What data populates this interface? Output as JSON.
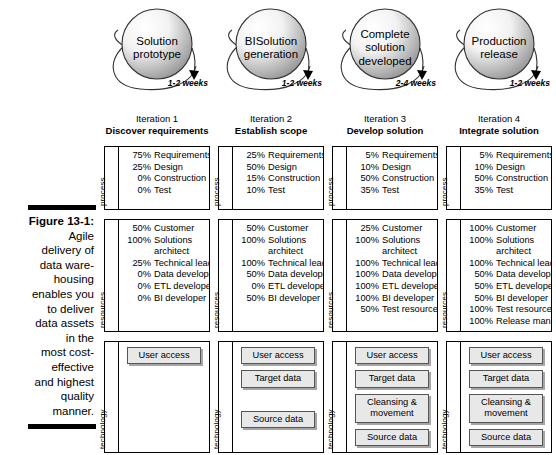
{
  "figure": {
    "label": "Figure 13-1:",
    "caption": "Agile delivery of data ware-housing enables you to deliver data assets in the most cost-effective and highest quality manner.",
    "caption_lines": [
      "Agile",
      "delivery of",
      "data ware-",
      "housing",
      "enables you",
      "to deliver",
      "data assets",
      "in the",
      "most cost-",
      "effective",
      "and highest",
      "quality",
      "manner."
    ]
  },
  "row_labels": {
    "process": "process",
    "resources": "resources",
    "technology": "technology"
  },
  "colors": {
    "sphere_light": "#f2f2f2",
    "sphere_dark": "#9a9a9a",
    "outline": "#000000",
    "tech_fill": "#e8e8e8",
    "tech_border": "#555555"
  },
  "columns": [
    {
      "sphere_label_lines": [
        "Solution",
        "prototype"
      ],
      "duration": "1-2 weeks",
      "iteration_number": "Iteration 1",
      "iteration_name": "Discover requirements",
      "process": [
        {
          "pct": "75%",
          "name": "Requirements"
        },
        {
          "pct": "25%",
          "name": "Design"
        },
        {
          "pct": "0%",
          "name": "Construction"
        },
        {
          "pct": "0%",
          "name": "Test"
        }
      ],
      "resources": [
        {
          "pct": "50%",
          "name": "Customer"
        },
        {
          "pct": "100%",
          "name": "Solutions",
          "cont": "architect"
        },
        {
          "pct": "25%",
          "name": "Technical lead"
        },
        {
          "pct": "0%",
          "name": "Data developer"
        },
        {
          "pct": "0%",
          "name": "ETL developer"
        },
        {
          "pct": "0%",
          "name": "BI developer"
        }
      ],
      "technology": [
        "User access"
      ]
    },
    {
      "sphere_label_lines": [
        "BISolution",
        "generation"
      ],
      "duration": "1-2 weeks",
      "iteration_number": "Iteration 2",
      "iteration_name": "Establish scope",
      "process": [
        {
          "pct": "25%",
          "name": "Requirements"
        },
        {
          "pct": "50%",
          "name": "Design"
        },
        {
          "pct": "15%",
          "name": "Construction"
        },
        {
          "pct": "10%",
          "name": "Test"
        }
      ],
      "resources": [
        {
          "pct": "50%",
          "name": "Customer"
        },
        {
          "pct": "100%",
          "name": "Solutions",
          "cont": "architect"
        },
        {
          "pct": "100%",
          "name": "Technical lead"
        },
        {
          "pct": "50%",
          "name": "Data developer"
        },
        {
          "pct": "0%",
          "name": "ETL developer"
        },
        {
          "pct": "50%",
          "name": "BI developer"
        }
      ],
      "technology": [
        "User access",
        "Target data",
        "",
        "Source data"
      ]
    },
    {
      "sphere_label_lines": [
        "Complete",
        "solution",
        "developed"
      ],
      "duration": "2-4 weeks",
      "iteration_number": "Iteration 3",
      "iteration_name": "Develop solution",
      "process": [
        {
          "pct": "5%",
          "name": "Requirements"
        },
        {
          "pct": "10%",
          "name": "Design"
        },
        {
          "pct": "50%",
          "name": "Construction"
        },
        {
          "pct": "35%",
          "name": "Test"
        }
      ],
      "resources": [
        {
          "pct": "25%",
          "name": "Customer"
        },
        {
          "pct": "100%",
          "name": "Solutions",
          "cont": "architect"
        },
        {
          "pct": "100%",
          "name": "Technical lead"
        },
        {
          "pct": "100%",
          "name": "Data developer"
        },
        {
          "pct": "100%",
          "name": "ETL developer"
        },
        {
          "pct": "100%",
          "name": "BI developer"
        },
        {
          "pct": "50%",
          "name": "Test resources"
        }
      ],
      "technology": [
        "User access",
        "Target data",
        "Cleansing & movement",
        "Source data"
      ]
    },
    {
      "sphere_label_lines": [
        "Production",
        "release"
      ],
      "duration": "1-2 weeks",
      "iteration_number": "Iteration 4",
      "iteration_name": "Integrate solution",
      "process": [
        {
          "pct": "5%",
          "name": "Requirements"
        },
        {
          "pct": "10%",
          "name": "Design"
        },
        {
          "pct": "50%",
          "name": "Construction"
        },
        {
          "pct": "35%",
          "name": "Test"
        }
      ],
      "resources": [
        {
          "pct": "100%",
          "name": "Customer"
        },
        {
          "pct": "100%",
          "name": "Solutions",
          "cont": "architect"
        },
        {
          "pct": "100%",
          "name": "Technical lead"
        },
        {
          "pct": "50%",
          "name": "Data developer"
        },
        {
          "pct": "50%",
          "name": "ETL developer"
        },
        {
          "pct": "50%",
          "name": "BI developer"
        },
        {
          "pct": "100%",
          "name": "Test resources"
        },
        {
          "pct": "100%",
          "name": "Release manager"
        }
      ],
      "technology": [
        "User access",
        "Target data",
        "Cleansing & movement",
        "Source data"
      ]
    }
  ]
}
